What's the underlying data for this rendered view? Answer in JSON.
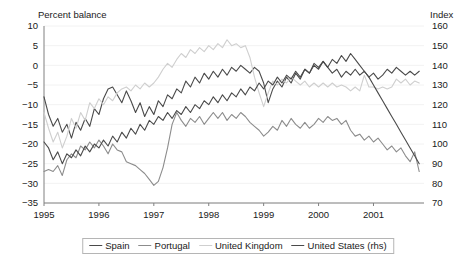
{
  "chart_data": {
    "type": "line",
    "title": "",
    "xlabel": "",
    "ylabel": "Percent balance",
    "y2label": "Index",
    "ylim": [
      -35,
      10
    ],
    "y2lim": [
      70,
      160
    ],
    "xlim": [
      1995.0,
      2001.92
    ],
    "grid": "horizontal-faint",
    "legend_position": "bottom-center",
    "yticks": [
      10,
      5,
      0,
      -5,
      -10,
      -15,
      -20,
      -25,
      -30,
      -35
    ],
    "ytick_labels": [
      "10",
      "5",
      "0",
      "−5",
      "−10",
      "−15",
      "−20",
      "−25",
      "−30",
      "−35"
    ],
    "y2ticks": [
      160,
      150,
      140,
      130,
      120,
      110,
      100,
      90,
      80,
      70
    ],
    "y2tick_labels": [
      "160",
      "150",
      "140",
      "130",
      "120",
      "110",
      "100",
      "90",
      "80",
      "70"
    ],
    "xticks": [
      1995,
      1996,
      1997,
      1998,
      1999,
      2000,
      2001
    ],
    "xtick_labels": [
      "1995",
      "1996",
      "1997",
      "1998",
      "1999",
      "2000",
      "2001"
    ],
    "series": [
      {
        "name": "Spain",
        "axis": "left",
        "color": "#4a4a4a",
        "x": [
          1995.0,
          1995.083,
          1995.167,
          1995.25,
          1995.333,
          1995.417,
          1995.5,
          1995.583,
          1995.667,
          1995.75,
          1995.833,
          1995.917,
          1996.0,
          1996.083,
          1996.167,
          1996.25,
          1996.333,
          1996.417,
          1996.5,
          1996.583,
          1996.667,
          1996.75,
          1996.833,
          1996.917,
          1997.0,
          1997.083,
          1997.167,
          1997.25,
          1997.333,
          1997.417,
          1997.5,
          1997.583,
          1997.667,
          1997.75,
          1997.833,
          1997.917,
          1998.0,
          1998.083,
          1998.167,
          1998.25,
          1998.333,
          1998.417,
          1998.5,
          1998.583,
          1998.667,
          1998.75,
          1998.833,
          1998.917,
          1999.0,
          1999.083,
          1999.167,
          1999.25,
          1999.333,
          1999.417,
          1999.5,
          1999.583,
          1999.667,
          1999.75,
          1999.833,
          1999.917,
          2000.0,
          2000.083,
          2000.167,
          2000.25,
          2000.333,
          2000.417,
          2000.5,
          2000.583,
          2000.667,
          2000.75,
          2000.833,
          2000.917,
          2001.0,
          2001.083,
          2001.167,
          2001.25,
          2001.333,
          2001.417,
          2001.5,
          2001.583,
          2001.667,
          2001.75,
          2001.833
        ],
        "values": [
          -8.0,
          -12.5,
          -15.5,
          -13.5,
          -17.0,
          -15.0,
          -18.5,
          -14.5,
          -16.5,
          -13.5,
          -15.5,
          -11.0,
          -12.5,
          -8.5,
          -6.0,
          -5.5,
          -7.5,
          -9.5,
          -6.5,
          -9.0,
          -12.0,
          -9.5,
          -13.0,
          -10.5,
          -12.5,
          -9.0,
          -10.5,
          -7.5,
          -8.5,
          -6.0,
          -7.0,
          -4.0,
          -5.5,
          -3.0,
          -4.5,
          -2.0,
          -3.5,
          -1.5,
          -3.0,
          -1.0,
          -2.5,
          -0.5,
          -1.5,
          0.0,
          -1.0,
          -2.0,
          -0.5,
          -1.5,
          -4.5,
          -9.5,
          -6.0,
          -4.0,
          -5.5,
          -3.0,
          -4.5,
          -2.0,
          -3.5,
          -1.0,
          -2.0,
          0.5,
          -0.5,
          1.0,
          -0.5,
          -2.0,
          -1.0,
          -3.0,
          -1.5,
          -2.5,
          -1.0,
          -2.5,
          -1.5,
          -3.0,
          -2.0,
          -3.5,
          -2.5,
          -1.0,
          -2.0,
          -0.5,
          -1.5,
          -2.5,
          -1.5,
          -2.5,
          -1.5
        ]
      },
      {
        "name": "Portugal",
        "axis": "left",
        "color": "#8c8c8c",
        "x": [
          1995.0,
          1995.083,
          1995.167,
          1995.25,
          1995.333,
          1995.417,
          1995.5,
          1995.583,
          1995.667,
          1995.75,
          1995.833,
          1995.917,
          1996.0,
          1996.083,
          1996.167,
          1996.25,
          1996.333,
          1996.417,
          1996.5,
          1996.583,
          1996.667,
          1996.75,
          1996.833,
          1996.917,
          1997.0,
          1997.083,
          1997.167,
          1997.25,
          1997.333,
          1997.417,
          1997.5,
          1997.583,
          1997.667,
          1997.75,
          1997.833,
          1997.917,
          1998.0,
          1998.083,
          1998.167,
          1998.25,
          1998.333,
          1998.417,
          1998.5,
          1998.583,
          1998.667,
          1998.75,
          1998.833,
          1998.917,
          1999.0,
          1999.083,
          1999.167,
          1999.25,
          1999.333,
          1999.417,
          1999.5,
          1999.583,
          1999.667,
          1999.75,
          1999.833,
          1999.917,
          2000.0,
          2000.083,
          2000.167,
          2000.25,
          2000.333,
          2000.417,
          2000.5,
          2000.583,
          2000.667,
          2000.75,
          2000.833,
          2000.917,
          2001.0,
          2001.083,
          2001.167,
          2001.25,
          2001.333,
          2001.417,
          2001.5,
          2001.583,
          2001.667,
          2001.75,
          2001.833
        ],
        "values": [
          -27.0,
          -26.5,
          -27.0,
          -25.5,
          -28.0,
          -24.0,
          -22.5,
          -23.5,
          -20.5,
          -21.5,
          -19.5,
          -21.0,
          -19.0,
          -20.5,
          -22.5,
          -20.0,
          -21.5,
          -22.0,
          -24.5,
          -25.0,
          -25.5,
          -26.5,
          -27.5,
          -29.0,
          -30.5,
          -29.5,
          -26.0,
          -21.0,
          -15.0,
          -12.0,
          -14.0,
          -15.5,
          -13.5,
          -14.5,
          -13.0,
          -15.0,
          -13.5,
          -12.0,
          -13.5,
          -12.0,
          -14.0,
          -12.5,
          -13.5,
          -12.0,
          -13.0,
          -14.5,
          -15.5,
          -16.5,
          -18.0,
          -17.0,
          -15.5,
          -16.5,
          -14.0,
          -15.5,
          -13.5,
          -15.0,
          -16.0,
          -14.5,
          -16.0,
          -15.0,
          -13.5,
          -14.5,
          -13.0,
          -14.0,
          -13.5,
          -15.0,
          -14.0,
          -16.5,
          -18.0,
          -17.5,
          -19.0,
          -18.0,
          -19.5,
          -18.5,
          -20.0,
          -21.5,
          -20.5,
          -22.0,
          -21.0,
          -23.0,
          -24.5,
          -22.0,
          -27.0
        ]
      },
      {
        "name": "United Kingdom",
        "axis": "left",
        "color": "#cfcfcf",
        "x": [
          1995.0,
          1995.083,
          1995.167,
          1995.25,
          1995.333,
          1995.417,
          1995.5,
          1995.583,
          1995.667,
          1995.75,
          1995.833,
          1995.917,
          1996.0,
          1996.083,
          1996.167,
          1996.25,
          1996.333,
          1996.417,
          1996.5,
          1996.583,
          1996.667,
          1996.75,
          1996.833,
          1996.917,
          1997.0,
          1997.083,
          1997.167,
          1997.25,
          1997.333,
          1997.417,
          1997.5,
          1997.583,
          1997.667,
          1997.75,
          1997.833,
          1997.917,
          1998.0,
          1998.083,
          1998.167,
          1998.25,
          1998.333,
          1998.417,
          1998.5,
          1998.583,
          1998.667,
          1998.75,
          1998.833,
          1998.917,
          1999.0,
          1999.083,
          1999.167,
          1999.25,
          1999.333,
          1999.417,
          1999.5,
          1999.583,
          1999.667,
          1999.75,
          1999.833,
          1999.917,
          2000.0,
          2000.083,
          2000.167,
          2000.25,
          2000.333,
          2000.417,
          2000.5,
          2000.583,
          2000.667,
          2000.75,
          2000.833,
          2000.917,
          2001.0,
          2001.083,
          2001.167,
          2001.25,
          2001.333,
          2001.417,
          2001.5,
          2001.583,
          2001.667,
          2001.75,
          2001.833
        ],
        "values": [
          -12.0,
          -16.0,
          -19.5,
          -17.0,
          -21.0,
          -18.0,
          -13.5,
          -16.0,
          -12.0,
          -14.0,
          -9.5,
          -11.0,
          -8.5,
          -10.0,
          -8.0,
          -9.0,
          -7.0,
          -6.0,
          -5.5,
          -6.5,
          -5.0,
          -6.0,
          -4.5,
          -5.5,
          -4.5,
          -3.0,
          -1.0,
          0.5,
          -0.5,
          1.5,
          3.0,
          2.0,
          4.0,
          3.0,
          4.5,
          3.5,
          5.0,
          4.0,
          5.5,
          4.5,
          6.5,
          5.0,
          5.5,
          4.5,
          5.0,
          2.0,
          -3.0,
          -7.0,
          -10.5,
          -7.0,
          -4.0,
          -5.0,
          -3.5,
          -4.5,
          -3.0,
          -4.0,
          -5.0,
          -4.0,
          -5.5,
          -4.5,
          -5.5,
          -4.5,
          -5.5,
          -4.5,
          -5.5,
          -5.0,
          -5.5,
          -6.5,
          -5.5,
          -6.5,
          -2.5,
          -5.5,
          -5.5,
          -6.0,
          -5.5,
          -6.0,
          -5.5,
          -3.5,
          -4.5,
          -3.5,
          -5.0,
          -4.0,
          -4.5
        ]
      },
      {
        "name": "United States (rhs)",
        "axis": "right",
        "color": "#4a4a4a",
        "x": [
          1995.0,
          1995.083,
          1995.167,
          1995.25,
          1995.333,
          1995.417,
          1995.5,
          1995.583,
          1995.667,
          1995.75,
          1995.833,
          1995.917,
          1996.0,
          1996.083,
          1996.167,
          1996.25,
          1996.333,
          1996.417,
          1996.5,
          1996.583,
          1996.667,
          1996.75,
          1996.833,
          1996.917,
          1997.0,
          1997.083,
          1997.167,
          1997.25,
          1997.333,
          1997.417,
          1997.5,
          1997.583,
          1997.667,
          1997.75,
          1997.833,
          1997.917,
          1998.0,
          1998.083,
          1998.167,
          1998.25,
          1998.333,
          1998.417,
          1998.5,
          1998.583,
          1998.667,
          1998.75,
          1998.833,
          1998.917,
          1999.0,
          1999.083,
          1999.167,
          1999.25,
          1999.333,
          1999.417,
          1999.5,
          1999.583,
          1999.667,
          1999.75,
          1999.833,
          1999.917,
          2000.0,
          2000.083,
          2000.167,
          2000.25,
          2000.333,
          2000.417,
          2000.5,
          2000.583,
          2000.667,
          2000.75,
          2000.833,
          2000.917,
          2001.0,
          2001.083,
          2001.167,
          2001.25,
          2001.333,
          2001.417,
          2001.5,
          2001.583,
          2001.667,
          2001.75,
          2001.833
        ],
        "values": [
          101,
          98,
          92,
          96,
          90,
          95,
          93,
          97,
          94,
          99,
          96,
          100,
          98,
          102,
          99,
          104,
          101,
          106,
          103,
          108,
          105,
          110,
          107,
          112,
          110,
          114,
          112,
          116,
          113,
          117,
          115,
          119,
          116,
          120,
          118,
          122,
          120,
          124,
          121,
          125,
          122,
          126,
          124,
          128,
          125,
          129,
          127,
          131,
          128,
          132,
          130,
          134,
          131,
          135,
          133,
          137,
          134,
          138,
          136,
          140,
          138,
          142,
          139,
          143,
          141,
          145,
          142,
          146,
          143,
          140,
          137,
          134,
          130,
          126,
          122,
          118,
          114,
          110,
          106,
          102,
          98,
          94,
          90
        ]
      }
    ]
  },
  "annotations": {
    "left_axis_title": "Percent balance",
    "right_axis_title": "Index"
  },
  "legend": {
    "entries": [
      {
        "label": "Spain",
        "color": "#4a4a4a"
      },
      {
        "label": "Portugal",
        "color": "#8c8c8c"
      },
      {
        "label": "United Kingdom",
        "color": "#cfcfcf"
      },
      {
        "label": "United States (rhs)",
        "color": "#4a4a4a"
      }
    ]
  }
}
